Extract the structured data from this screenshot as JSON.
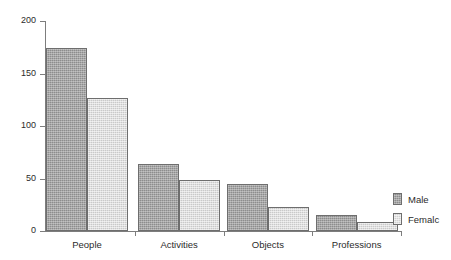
{
  "chart_data": {
    "type": "bar",
    "title": "",
    "subtitle": "",
    "xlabel": "",
    "ylabel": "",
    "categories": [
      "People",
      "Activities",
      "Objects",
      "Professions"
    ],
    "series": [
      {
        "name": "Male",
        "values": [
          174,
          64,
          45,
          15
        ],
        "color": "#8d8d8d"
      },
      {
        "name": "Femalc",
        "values": [
          127,
          49,
          23,
          9
        ],
        "color": "#c9c9c9"
      }
    ],
    "ylim": [
      0,
      200
    ],
    "yticks": [
      0,
      50,
      100,
      150,
      200
    ],
    "ytick_labels": [
      "0",
      "50",
      "100",
      "150",
      "200"
    ],
    "grid": false,
    "legend_position": "right",
    "axis_color": "#7d7d7d",
    "bar_outline_color": "#6e6e6e",
    "background": "#ffffff"
  },
  "legend": {
    "entries": [
      {
        "label": "Male"
      },
      {
        "label": "Femalc"
      }
    ]
  }
}
